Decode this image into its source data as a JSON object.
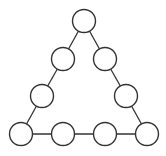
{
  "diagram": {
    "type": "triangular-node-graph",
    "stroke_color": "#333333",
    "fill_color": "#ffffff",
    "node_radius": 11.5,
    "nodes": [
      {
        "id": "n1",
        "x": 84,
        "y": 21
      },
      {
        "id": "n2",
        "x": 63,
        "y": 59
      },
      {
        "id": "n3",
        "x": 105,
        "y": 59
      },
      {
        "id": "n4",
        "x": 42,
        "y": 96
      },
      {
        "id": "n5",
        "x": 126,
        "y": 96
      },
      {
        "id": "n6",
        "x": 21,
        "y": 134
      },
      {
        "id": "n7",
        "x": 63,
        "y": 134
      },
      {
        "id": "n8",
        "x": 105,
        "y": 134
      },
      {
        "id": "n9",
        "x": 147,
        "y": 134
      }
    ],
    "edges": [
      [
        "n1",
        "n2"
      ],
      [
        "n2",
        "n4"
      ],
      [
        "n4",
        "n6"
      ],
      [
        "n1",
        "n3"
      ],
      [
        "n3",
        "n5"
      ],
      [
        "n5",
        "n9"
      ],
      [
        "n6",
        "n7"
      ],
      [
        "n7",
        "n8"
      ],
      [
        "n8",
        "n9"
      ]
    ]
  }
}
